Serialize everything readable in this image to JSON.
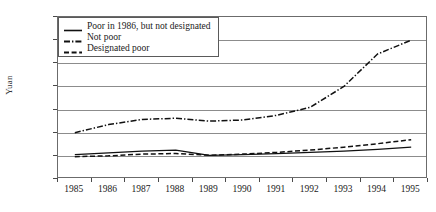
{
  "chart_data": {
    "type": "line",
    "title": "",
    "xlabel": "",
    "ylabel": "Yuan",
    "x": [
      "1985",
      "1986",
      "1987",
      "1988",
      "1989",
      "1990",
      "1991",
      "1992",
      "1993",
      "1994",
      "1995"
    ],
    "categories": [
      "1985",
      "1986",
      "1987",
      "1988",
      "1989",
      "1990",
      "1991",
      "1992",
      "1993",
      "1994",
      "1995"
    ],
    "ylim": [
      0,
      1500
    ],
    "yticks": [
      0,
      300,
      500,
      700,
      900,
      1100,
      1300,
      1500
    ],
    "ytick_labels": [
      "0",
      "300",
      "500",
      "700",
      "900",
      "1,100",
      "1,300",
      "1,500"
    ],
    "grid": true,
    "legend_position": "top-left",
    "series": [
      {
        "name": "Poor in 1986, but not designated",
        "style": "solid",
        "values": [
          310,
          325,
          340,
          350,
          305,
          310,
          320,
          330,
          340,
          355,
          375
        ]
      },
      {
        "name": "Not poor",
        "style": "dash-dot",
        "values": [
          500,
          570,
          615,
          625,
          600,
          610,
          650,
          720,
          900,
          1180,
          1300
        ]
      },
      {
        "name": "Designated poor",
        "style": "dashed",
        "values": [
          290,
          300,
          315,
          320,
          305,
          315,
          330,
          350,
          375,
          405,
          440
        ]
      }
    ]
  },
  "axis": {
    "y_title": "Yuan"
  },
  "legend": {
    "entries": [
      {
        "label": "Poor in 1986, but not designated",
        "style": "solid"
      },
      {
        "label": "Not poor",
        "style": "dash-dot"
      },
      {
        "label": "Designated poor",
        "style": "dashed"
      }
    ]
  },
  "colors": {
    "line": "#111111",
    "grid": "#8c8c8c",
    "frame": "#6b6b6b",
    "text": "#1a1a1a",
    "background": "#ffffff"
  }
}
